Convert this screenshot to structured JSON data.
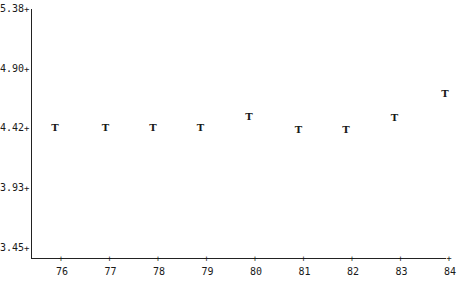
{
  "chart_data": {
    "type": "scatter",
    "xlabel": "",
    "ylabel": "",
    "marker": "T",
    "x": [
      "76",
      "77",
      "78",
      "79",
      "80",
      "81",
      "82",
      "83",
      "84"
    ],
    "series": [
      {
        "name": "T",
        "values": [
          4.42,
          4.42,
          4.42,
          4.42,
          4.51,
          4.4,
          4.4,
          4.5,
          4.69
        ]
      }
    ],
    "yticks": [
      "5.38",
      "4.90",
      "4.42",
      "3.93",
      "3.45"
    ],
    "xticks": [
      "76",
      "77",
      "78",
      "79",
      "80",
      "81",
      "82",
      "83",
      "84"
    ],
    "ylim": [
      3.45,
      5.38
    ],
    "grid": false,
    "legend": null
  },
  "axis": {
    "tick_mark": "+"
  }
}
